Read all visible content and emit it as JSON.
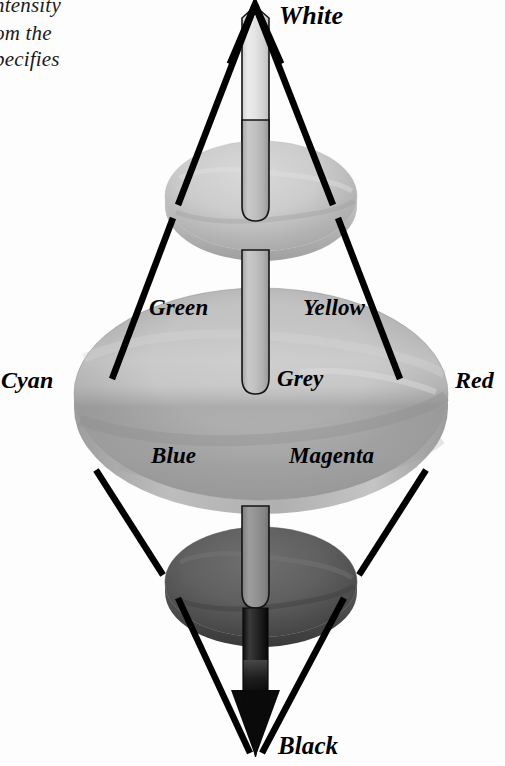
{
  "figure": {
    "clipped_body_text": {
      "line1": "ntensity",
      "line2": "om the",
      "line3": "pecifies"
    },
    "labels": {
      "white": "White",
      "green": "Green",
      "yellow": "Yellow",
      "cyan": "Cyan",
      "grey": "Grey",
      "red": "Red",
      "blue": "Blue",
      "magenta": "Magenta",
      "black": "Black"
    },
    "colors": {
      "outline": "#000000",
      "background": "#fdfdfd",
      "top_disk_light": "#d8d8d8",
      "top_disk_dark": "#9a9a9a",
      "mid_disk_light": "#c6c6c6",
      "mid_disk_dark": "#8a8a8a",
      "bottom_disk_light": "#6e6e6e",
      "bottom_disk_dark": "#3a3a3a",
      "axis_top": "#f2f2f2",
      "axis_mid": "#b4b4b4",
      "axis_bottom": "#0a0a0a",
      "text": "#000000"
    },
    "geometry": {
      "apex_top": {
        "x": 255,
        "y": 3
      },
      "apex_bottom": {
        "x": 255,
        "y": 757
      },
      "vertex_left": {
        "x": 75,
        "y": 383
      },
      "vertex_right": {
        "x": 448,
        "y": 383
      },
      "main_ellipse": {
        "cx": 261,
        "cy": 394,
        "rx": 187,
        "ry": 106
      },
      "upper_disk": {
        "cx": 261,
        "cy": 196,
        "rx": 96,
        "ry": 55
      },
      "lower_disk": {
        "cx": 261,
        "cy": 582,
        "rx": 96,
        "ry": 55
      },
      "axis_width": 26
    }
  }
}
